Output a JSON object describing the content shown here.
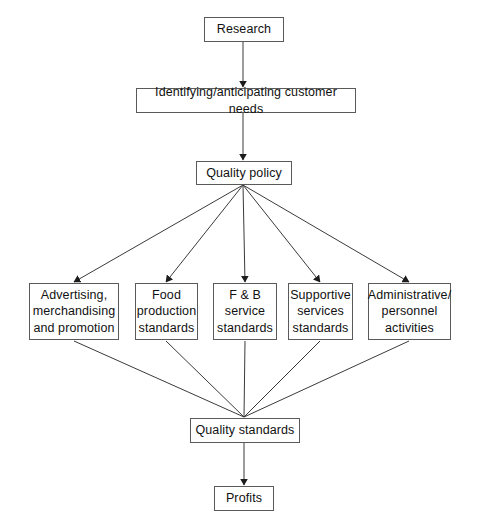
{
  "diagram": {
    "type": "flowchart",
    "background_color": "#ffffff",
    "box_border_color": "#5a5a5a",
    "edge_color": "#3a3a3a",
    "text_color": "#111111",
    "nodes": [
      {
        "id": "research",
        "label": "Research",
        "x": 204,
        "y": 17,
        "w": 80,
        "h": 25
      },
      {
        "id": "identifying-needs",
        "label": "Identifying/anticipating customer needs",
        "x": 136,
        "y": 88,
        "w": 220,
        "h": 25
      },
      {
        "id": "quality-policy",
        "label": "Quality policy",
        "x": 196,
        "y": 161,
        "w": 96,
        "h": 24
      },
      {
        "id": "advertising",
        "label": "Advertising,\nmerchandising\nand promotion",
        "x": 29,
        "y": 283,
        "w": 90,
        "h": 57
      },
      {
        "id": "food-production",
        "label": "Food\nproduction\nstandards",
        "x": 135,
        "y": 283,
        "w": 63,
        "h": 57
      },
      {
        "id": "fb-service",
        "label": "F & B\nservice\nstandards",
        "x": 213,
        "y": 283,
        "w": 64,
        "h": 57
      },
      {
        "id": "supportive-services",
        "label": "Supportive\nservices\nstandards",
        "x": 288,
        "y": 283,
        "w": 65,
        "h": 57
      },
      {
        "id": "administrative",
        "label": "Administrative/\npersonnel\nactivities",
        "x": 368,
        "y": 283,
        "w": 83,
        "h": 57
      },
      {
        "id": "quality-standards",
        "label": "Quality standards",
        "x": 190,
        "y": 418,
        "w": 110,
        "h": 25
      },
      {
        "id": "profits",
        "label": "Profits",
        "x": 214,
        "y": 486,
        "w": 60,
        "h": 25
      }
    ],
    "edges": [
      {
        "id": "research-to-needs",
        "from": "research",
        "to": "identifying-needs",
        "arrow": true,
        "x1": 243,
        "y1": 42,
        "x2": 243,
        "y2": 87
      },
      {
        "id": "needs-to-policy",
        "from": "identifying-needs",
        "to": "quality-policy",
        "arrow": true,
        "x1": 243,
        "y1": 113,
        "x2": 243,
        "y2": 160
      },
      {
        "id": "policy-to-advertising",
        "from": "quality-policy",
        "to": "advertising",
        "arrow": true,
        "x1": 243,
        "y1": 185,
        "x2": 74,
        "y2": 282
      },
      {
        "id": "policy-to-food-production",
        "from": "quality-policy",
        "to": "food-production",
        "arrow": true,
        "x1": 243,
        "y1": 185,
        "x2": 166,
        "y2": 282
      },
      {
        "id": "policy-to-fb-service",
        "from": "quality-policy",
        "to": "fb-service",
        "arrow": true,
        "x1": 243,
        "y1": 185,
        "x2": 245,
        "y2": 282
      },
      {
        "id": "policy-to-supportive-services",
        "from": "quality-policy",
        "to": "supportive-services",
        "arrow": true,
        "x1": 243,
        "y1": 185,
        "x2": 320,
        "y2": 282
      },
      {
        "id": "policy-to-administrative",
        "from": "quality-policy",
        "to": "administrative",
        "arrow": true,
        "x1": 243,
        "y1": 185,
        "x2": 409,
        "y2": 282
      },
      {
        "id": "advertising-to-standards",
        "from": "advertising",
        "to": "quality-standards",
        "arrow": false,
        "x1": 74,
        "y1": 341,
        "x2": 244,
        "y2": 417
      },
      {
        "id": "food-production-to-standards",
        "from": "food-production",
        "to": "quality-standards",
        "arrow": false,
        "x1": 166,
        "y1": 341,
        "x2": 244,
        "y2": 417
      },
      {
        "id": "fb-service-to-standards",
        "from": "fb-service",
        "to": "quality-standards",
        "arrow": false,
        "x1": 245,
        "y1": 341,
        "x2": 244,
        "y2": 417
      },
      {
        "id": "supportive-services-to-standards",
        "from": "supportive-services",
        "to": "quality-standards",
        "arrow": false,
        "x1": 320,
        "y1": 341,
        "x2": 244,
        "y2": 417
      },
      {
        "id": "administrative-to-standards",
        "from": "administrative",
        "to": "quality-standards",
        "arrow": false,
        "x1": 409,
        "y1": 341,
        "x2": 244,
        "y2": 417
      },
      {
        "id": "standards-to-profits",
        "from": "quality-standards",
        "to": "profits",
        "arrow": true,
        "x1": 244,
        "y1": 443,
        "x2": 244,
        "y2": 485
      }
    ]
  }
}
